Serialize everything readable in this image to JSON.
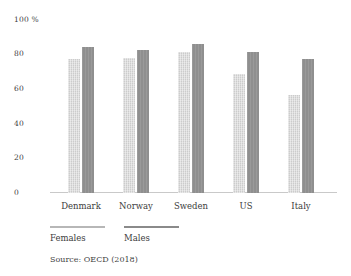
{
  "chart_data": {
    "type": "bar",
    "title": "",
    "categories": [
      "Denmark",
      "Norway",
      "Sweden",
      "US",
      "Italy"
    ],
    "series": [
      {
        "name": "Females",
        "values": [
          77,
          78,
          81.5,
          68.5,
          56.5
        ],
        "bar_color": "#cccccc",
        "legend_line_color": "#b7b7b7"
      },
      {
        "name": "Males",
        "values": [
          84,
          82.5,
          86,
          81,
          77.5
        ],
        "bar_color": "#8f8f8f",
        "legend_line_color": "#8a8a8a"
      }
    ],
    "unit": "%",
    "y_ticks": [
      {
        "value": 100,
        "label": "100 %"
      },
      {
        "value": 80,
        "label": "80"
      },
      {
        "value": 60,
        "label": "60"
      },
      {
        "value": 40,
        "label": "40"
      },
      {
        "value": 20,
        "label": "20"
      },
      {
        "value": 0,
        "label": "0"
      }
    ],
    "ylim": [
      0,
      100
    ],
    "grid": false,
    "legend_position": "bottom-left",
    "source": "Source: OECD (2018)"
  },
  "colors": {
    "background": "#ffffff",
    "axis_line": "#c9c9c9",
    "text": "#3c3c3c"
  }
}
